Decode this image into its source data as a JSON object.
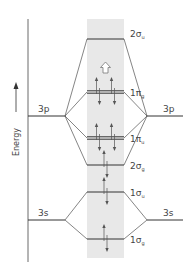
{
  "axis": {
    "label": "Energy"
  },
  "colors": {
    "band": "#e8e8e8",
    "line": "#333333",
    "arrow": "#555555",
    "text": "#444444"
  },
  "atomic_left": [
    {
      "label": "3p",
      "y": 116
    },
    {
      "label": "3s",
      "y": 220
    }
  ],
  "atomic_right": [
    {
      "label": "3p",
      "y": 116
    },
    {
      "label": "3s",
      "y": 220
    }
  ],
  "molecular_orbitals": [
    {
      "name": "2σu",
      "main": "2σ",
      "sub": "u",
      "y": 39,
      "double": false,
      "electrons": 0
    },
    {
      "name": "1πg",
      "main": "1π",
      "sub": "g",
      "y": 92,
      "double": true,
      "electrons": 4
    },
    {
      "name": "1πu",
      "main": "1π",
      "sub": "u",
      "y": 138,
      "double": true,
      "electrons": 4
    },
    {
      "name": "2σg",
      "main": "2σ",
      "sub": "g",
      "y": 165,
      "double": false,
      "electrons": 2
    },
    {
      "name": "1σu",
      "main": "1σ",
      "sub": "u",
      "y": 192,
      "double": false,
      "electrons": 2
    },
    {
      "name": "1σg",
      "main": "1σ",
      "sub": "g",
      "y": 239,
      "double": false,
      "electrons": 2
    }
  ],
  "annotation": {
    "hollow_arrow": "up",
    "y": 67
  }
}
